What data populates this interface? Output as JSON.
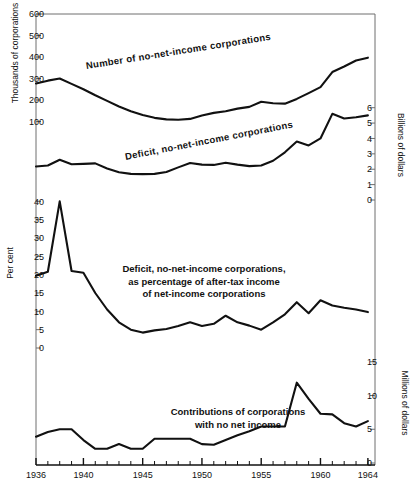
{
  "figure": {
    "background": "#ffffff",
    "line_color": "#111111",
    "axis_color": "#666666"
  },
  "axes": {
    "x": {
      "label": "",
      "tick_labels": [
        "1936",
        "1940",
        "1945",
        "1950",
        "1955",
        "1960",
        "1964"
      ],
      "tick_years": [
        1936,
        1940,
        1945,
        1950,
        1955,
        1960,
        1964
      ],
      "range": [
        1936,
        1964.6
      ],
      "minor_tick_step": 1
    },
    "left_top": {
      "label": "Thousands of corporations",
      "tick_labels": [
        "600",
        "500",
        "400",
        "300",
        "200",
        "100"
      ],
      "tick_values": [
        600,
        500,
        400,
        300,
        200,
        100
      ]
    },
    "left_percent": {
      "label": "Per cent",
      "tick_labels": [
        "40",
        "35",
        "30",
        "25",
        "20",
        "15",
        "10",
        "5",
        "0"
      ],
      "tick_values": [
        40,
        35,
        30,
        25,
        20,
        15,
        10,
        5,
        0
      ]
    },
    "right_billions": {
      "label": "Billions of dollars",
      "tick_labels": [
        "6",
        "5",
        "4",
        "3",
        "2",
        "1",
        "0"
      ],
      "tick_values": [
        6,
        5,
        4,
        3,
        2,
        1,
        0
      ]
    },
    "right_millions": {
      "label": "Millions of dollars",
      "tick_labels": [
        "15",
        "10",
        "5",
        "0"
      ],
      "tick_values": [
        15,
        10,
        5,
        0
      ]
    }
  },
  "series_labels": {
    "number": "Number of no-net-income corporations",
    "deficit": "Deficit, no-net-income corporations",
    "percent_line1": "Deficit, no-net-income corporations,",
    "percent_line2": "as percentage of after-tax income",
    "percent_line3": "of net-income corporations",
    "contrib_line1": "Contributions of corporations",
    "contrib_line2": "with no net income"
  },
  "chart_data": {
    "type": "line",
    "title": "",
    "xlabel": "",
    "xlim": [
      1936,
      1964.6
    ],
    "grid": false,
    "legend": "inline-annotations",
    "x": [
      1936,
      1937,
      1938,
      1939,
      1940,
      1941,
      1942,
      1943,
      1944,
      1945,
      1946,
      1947,
      1948,
      1949,
      1950,
      1951,
      1952,
      1953,
      1954,
      1955,
      1956,
      1957,
      1958,
      1959,
      1960,
      1961,
      1962,
      1963,
      1964
    ],
    "series": [
      {
        "name": "Number of no-net-income corporations",
        "ylabel": "Thousands of corporations",
        "units": "thousands",
        "ylim": [
          0,
          600
        ],
        "panel": 1,
        "values": [
          277,
          290,
          300,
          275,
          250,
          222,
          196,
          170,
          148,
          130,
          117,
          110,
          108,
          112,
          128,
          140,
          148,
          160,
          168,
          192,
          185,
          183,
          205,
          232,
          260,
          330,
          356,
          384,
          397
        ]
      },
      {
        "name": "Deficit, no-net-income corporations",
        "ylabel": "Billions of dollars",
        "units": "billions of dollars",
        "ylim": [
          0,
          6.5
        ],
        "panel": 2,
        "values": [
          2.18,
          2.24,
          2.62,
          2.32,
          2.35,
          2.38,
          2.05,
          1.8,
          1.7,
          1.68,
          1.7,
          1.82,
          2.12,
          2.4,
          2.3,
          2.28,
          2.42,
          2.3,
          2.2,
          2.24,
          2.55,
          3.1,
          3.8,
          3.55,
          4.0,
          5.6,
          5.3,
          5.38,
          5.5
        ]
      },
      {
        "name": "Deficit as percentage of after-tax income of net-income corporations",
        "ylabel": "Per cent",
        "units": "per cent",
        "ylim": [
          0,
          42
        ],
        "panel": 3,
        "values": [
          19.7,
          20.8,
          40.0,
          21.0,
          20.5,
          15.0,
          10.5,
          7.0,
          5.0,
          4.2,
          4.8,
          5.2,
          6.0,
          7.0,
          6.0,
          6.6,
          8.8,
          7.0,
          6.1,
          5.0,
          7.0,
          9.2,
          12.5,
          9.5,
          13.0,
          11.6,
          11.0,
          10.5,
          9.8
        ]
      },
      {
        "name": "Contributions of corporations with no net income",
        "ylabel": "Millions of dollars",
        "units": "millions of dollars",
        "ylim": [
          0,
          16
        ],
        "panel": 4,
        "values": [
          3.9,
          4.6,
          5.0,
          5.0,
          3.4,
          2.1,
          2.1,
          2.8,
          2.1,
          2.1,
          3.6,
          3.6,
          3.6,
          3.6,
          2.8,
          2.7,
          3.4,
          4.1,
          4.7,
          5.4,
          5.4,
          5.4,
          11.9,
          9.5,
          7.3,
          7.2,
          5.9,
          5.4,
          6.2
        ]
      }
    ]
  }
}
